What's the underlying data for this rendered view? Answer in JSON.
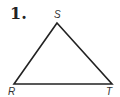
{
  "problem": {
    "number": "1."
  },
  "triangle": {
    "vertices": [
      {
        "label": "S",
        "x": 57,
        "y": 23
      },
      {
        "label": "R",
        "x": 14,
        "y": 84
      },
      {
        "label": "T",
        "x": 112,
        "y": 84
      }
    ],
    "stroke": "#222222"
  }
}
